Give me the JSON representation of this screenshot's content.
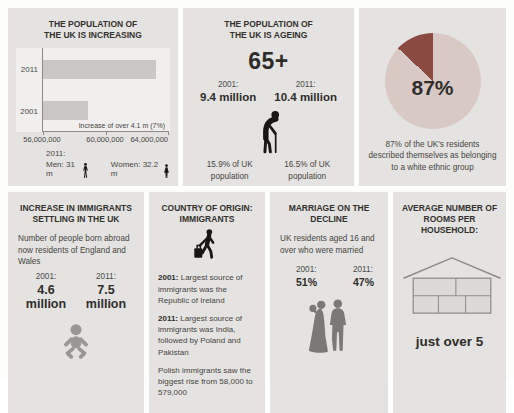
{
  "colors": {
    "panel_bg": "#e5e3e1",
    "plot_bg": "#f1efee",
    "bar": "#c9c8c6",
    "pie_light": "#d9c9c5",
    "pie_dark": "#8a4a42",
    "title_text": "#33312e",
    "body_text": "#45443f",
    "icon_black": "#181715",
    "icon_gray": "#999795",
    "icon_couple": "#7b7977",
    "house_stroke": "#8f8d8a"
  },
  "icons": {
    "man-icon": "standing male silhouette",
    "woman-icon": "standing female silhouette",
    "elderly-person-icon": "hunched elderly person with walking cane",
    "baby-icon": "baby silhouette",
    "traveler-icon": "walking person with suitcase",
    "wedding-couple-icon": "bride and groom silhouette",
    "house-icon": "house outline with five rooms"
  },
  "panels": {
    "population_increasing": {
      "title": "THE POPULATION OF\nTHE UK IS INCREASING",
      "footnote_year": "2011:",
      "men_label": "Men: 31 m",
      "women_label": "Women: 32.2 m"
    },
    "population_ageing": {
      "title": "THE POPULATION OF\nTHE UK IS AGEING",
      "age_group": "65+",
      "year_2001_label": "2001:",
      "value_2001": "9.4 million",
      "year_2011_label": "2011:",
      "value_2011": "10.4 million",
      "share_2001": "15.9% of UK\npopulation",
      "share_2011": "16.5% of UK\npopulation"
    },
    "ethnicity": {
      "caption": "87% of the UK's residents\ndescribed themselves as belonging\nto a white ethnic group"
    },
    "immigrants_increase": {
      "title": "INCREASE IN IMMIGRANTS\nSETTLING IN THE UK",
      "subtitle": "Number of people born abroad\nnow residents of England and Wales",
      "year_2001_label": "2001:",
      "value_2001": "4.6 million",
      "year_2011_label": "2011:",
      "value_2011": "7.5 million"
    },
    "immigrants_origin": {
      "title": "COUNTRY OF ORIGIN:\nIMMIGRANTS",
      "fact_2001_year": "2001:",
      "fact_2001_text": " Largest source of immigrants was the Republic of Ireland",
      "fact_2011_year": "2011:",
      "fact_2011_text": " Largest source of immigrants was India, followed by Poland and Pakistan",
      "fact_polish": "Polish immigrants saw the biggest rise from 58,000 to 579,000"
    },
    "marriage": {
      "title": "MARRIAGE ON THE\nDECLINE",
      "subtitle": "UK residents aged 16 and\nover who were married",
      "year_2001_label": "2001:",
      "value_2001": "51%",
      "year_2011_label": "2011:",
      "value_2011": "47%"
    },
    "rooms": {
      "title": "AVERAGE NUMBER OF\nROOMS PER\nHOUSEHOLD:",
      "value": "just over 5"
    }
  },
  "chart_data": [
    {
      "type": "bar",
      "orientation": "horizontal",
      "title": "THE POPULATION OF THE UK IS INCREASING",
      "categories": [
        "2011",
        "2001"
      ],
      "values": [
        63.2,
        58.9
      ],
      "value_unit": "million people",
      "xlim": [
        56,
        64
      ],
      "x_tick_labels": [
        "56,000,000",
        "60,000,000",
        "64,000,000"
      ],
      "annotation": "Increase of over 4.1 m (7%)",
      "bar_color": "#c9c8c6",
      "legend": "none",
      "grid": false
    },
    {
      "type": "pie",
      "labels": [
        "White ethnic group",
        "Other ethnic groups"
      ],
      "values": [
        87,
        13
      ],
      "colors": [
        "#d9c9c5",
        "#8a4a42"
      ],
      "center_label": "87%"
    }
  ]
}
